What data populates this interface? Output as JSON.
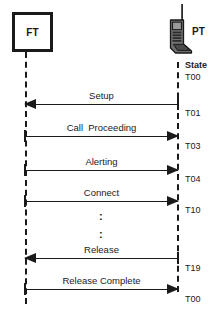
{
  "diagram": {
    "left_entity": {
      "label": "FT",
      "icon": "fixed-terminal-box-icon"
    },
    "right_entity": {
      "label": "PT",
      "icon": "portable-handset-icon"
    },
    "state_column_header": "State",
    "ellipsis_glyph": ":",
    "colors": {
      "ink": "#1a1a1a",
      "background": "#ffffff"
    },
    "messages": [
      {
        "label": "Setup",
        "direction": "right-to-left",
        "state_after": "T01"
      },
      {
        "label": "Call  Proceeding",
        "direction": "left-to-right",
        "state_after": "T03"
      },
      {
        "label": "Alerting",
        "direction": "left-to-right",
        "state_after": "T04"
      },
      {
        "label": "Connect",
        "direction": "left-to-right",
        "state_after": "T10"
      },
      {
        "label": "Release",
        "direction": "right-to-left",
        "state_after": "T19"
      },
      {
        "label": "Release Complete",
        "direction": "left-to-right",
        "state_after": "T00"
      }
    ],
    "states": {
      "initial": "T00",
      "s1": "T01",
      "s2": "T03",
      "s3": "T04",
      "s4": "T10",
      "s5": "T19",
      "s6": "T00"
    }
  }
}
